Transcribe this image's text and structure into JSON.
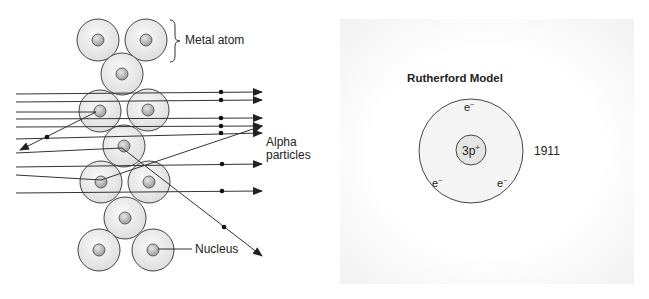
{
  "scattering_diagram": {
    "labels": {
      "metal_atom": "Metal atom",
      "alpha_line1": "Alpha",
      "alpha_line2": "particles",
      "nucleus": "Nucleus"
    },
    "atoms": [
      {
        "cx": 98,
        "cy": 40
      },
      {
        "cx": 146,
        "cy": 40
      },
      {
        "cx": 122,
        "cy": 74
      },
      {
        "cx": 100,
        "cy": 111
      },
      {
        "cx": 148,
        "cy": 110
      },
      {
        "cx": 124,
        "cy": 146
      },
      {
        "cx": 101,
        "cy": 182
      },
      {
        "cx": 149,
        "cy": 182
      },
      {
        "cx": 125,
        "cy": 218
      },
      {
        "cx": 99,
        "cy": 250
      },
      {
        "cx": 153,
        "cy": 250
      }
    ],
    "colors": {
      "atom_fill": "#ececec",
      "nucleus_fill": "#bdbdbd",
      "line": "#333333"
    }
  },
  "rutherford_model": {
    "title": "Rutherford Model",
    "nucleus_label": "3p",
    "nucleus_charge": "+",
    "electron_label": "e",
    "electron_charge": "−",
    "year": "1911",
    "electron_count": 3
  }
}
